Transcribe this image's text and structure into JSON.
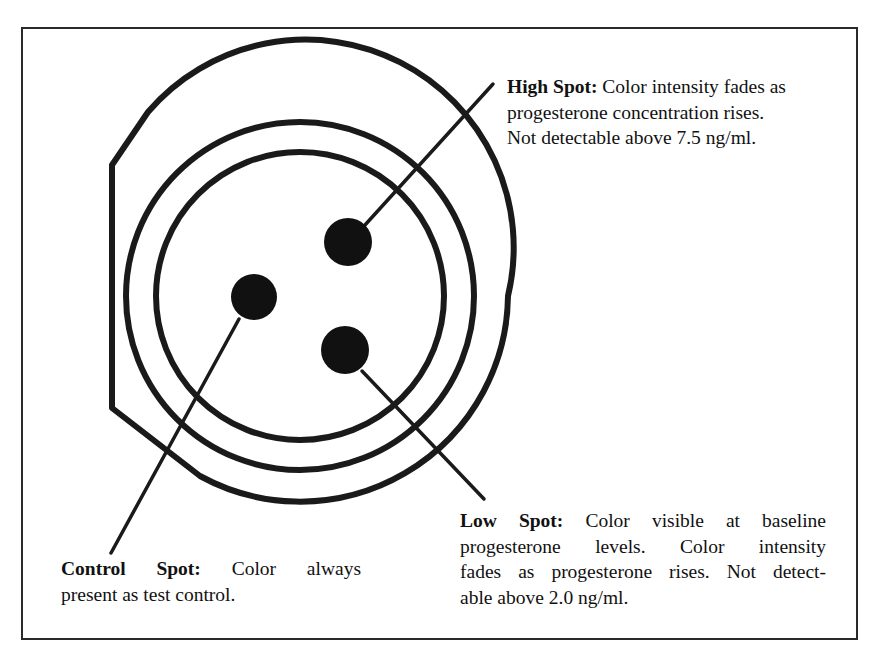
{
  "figure": {
    "background_color": "#ffffff",
    "ink_color": "#1a1a1a",
    "frame_color": "#2a2a2a"
  },
  "device": {
    "outline_name": "test-cassette-outline",
    "rings": [
      {
        "name": "outer-ring",
        "radius": 208
      },
      {
        "name": "middle-ring",
        "radius": 174
      }
    ],
    "center": {
      "x": 300,
      "y": 296
    }
  },
  "spots": [
    {
      "id": "control",
      "name": "control-spot",
      "cx": 254,
      "cy": 297,
      "r": 23,
      "color": "#111111"
    },
    {
      "id": "high",
      "name": "high-spot",
      "cx": 348,
      "cy": 242,
      "r": 24,
      "color": "#111111"
    },
    {
      "id": "low",
      "name": "low-spot",
      "cx": 345,
      "cy": 350,
      "r": 24,
      "color": "#111111"
    }
  ],
  "leader_lines": [
    {
      "name": "high-spot-leader",
      "x1": 365,
      "y1": 225,
      "x2": 493,
      "y2": 84
    },
    {
      "name": "low-spot-leader",
      "x1": 362,
      "y1": 371,
      "x2": 484,
      "y2": 499
    },
    {
      "name": "control-spot-leader",
      "x1": 239,
      "y1": 319,
      "x2": 111,
      "y2": 553
    }
  ],
  "annotations": {
    "high": {
      "label": "High Spot:",
      "line1_rest": " Color intensity fades as",
      "line2": "progesterone concentration rises.",
      "line3": "Not detectable above 7.5 ng/ml.",
      "full_text": "High Spot: Color intensity fades as progesterone concentration rises. Not detectable above 7.5 ng/ml.",
      "threshold": "7.5 ng/ml"
    },
    "low": {
      "label": "Low Spot:",
      "line1_rest": " Color visible at baseline",
      "line2": "progesterone levels. Color intensity",
      "line3": "fades as progesterone rises. Not detect-",
      "line4": "able above 2.0 ng/ml.",
      "full_text": "Low Spot: Color visible at baseline progesterone levels. Color intensity fades as progesterone rises. Not detectable above 2.0 ng/ml.",
      "threshold": "2.0 ng/ml"
    },
    "control": {
      "label": "Control Spot:",
      "line1_rest": " Color always",
      "line2": "present as test control.",
      "full_text": "Control Spot: Color always present as test control."
    }
  }
}
